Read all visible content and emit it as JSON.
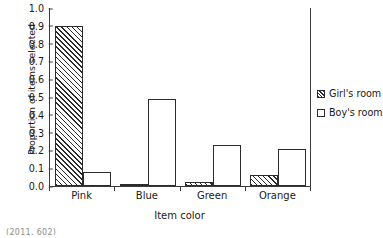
{
  "chart_data": {
    "type": "bar",
    "title": "",
    "xlabel": "Item color",
    "ylabel": "Proportion of items selected",
    "categories": [
      "Pink",
      "Blue",
      "Green",
      "Orange"
    ],
    "series": [
      {
        "name": "Girl's room",
        "fill": "diagonal-hatch",
        "values": [
          0.9,
          0.01,
          0.02,
          0.06
        ]
      },
      {
        "name": "Boy's room",
        "fill": "white",
        "values": [
          0.08,
          0.49,
          0.23,
          0.21
        ]
      }
    ],
    "ylim": [
      0.0,
      1.0
    ],
    "yticks": [
      "1.0",
      "0.9",
      "0.8",
      "0.7",
      "0.6",
      "0.5",
      "0.4",
      "0.3",
      "0.2",
      "0.1",
      "0.0"
    ],
    "ytick_values": [
      1.0,
      0.9,
      0.8,
      0.7,
      0.6,
      0.5,
      0.4,
      0.3,
      0.2,
      0.1,
      0.0
    ],
    "grid": false,
    "legend_position": "right",
    "colors": {
      "axis": "#3a3a3a",
      "bar_outline": "#2b2b2b",
      "hatch": "#2b2b2b",
      "bar_fill": "#ffffff",
      "text": "#1a1a1a"
    }
  },
  "caption_fragment": "(2011,    602)"
}
